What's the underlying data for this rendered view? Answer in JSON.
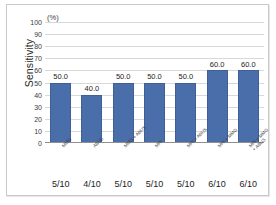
{
  "chart_data": {
    "type": "bar",
    "title": "",
    "xlabel": "",
    "ylabel": "Sensitivity",
    "unit_label": "(%)",
    "ylim": [
      0,
      100
    ],
    "ytick_step": 10,
    "grid": true,
    "legend": "none",
    "bar_color": "#4a6ea9",
    "categories": [
      "MMG",
      "ABUS",
      "MMG + ABUS",
      "MRI",
      "MRI + ABUS",
      "MRI + MMG",
      "MRI + MMG\n+ ABUS"
    ],
    "values": [
      50.0,
      40.0,
      50.0,
      50.0,
      50.0,
      60.0,
      60.0
    ],
    "data_labels": [
      "50.0",
      "40.0",
      "50.0",
      "50.0",
      "50.0",
      "60.0",
      "60.0"
    ],
    "fractions": [
      "5/10",
      "4/10",
      "5/10",
      "5/10",
      "5/10",
      "6/10",
      "6/10"
    ],
    "ytick_labels": [
      "100",
      "90",
      "80",
      "70",
      "60",
      "50",
      "40",
      "30",
      "20",
      "10",
      "0"
    ],
    "ytick_values": [
      100,
      90,
      80,
      70,
      60,
      50,
      40,
      30,
      20,
      10,
      0
    ]
  }
}
